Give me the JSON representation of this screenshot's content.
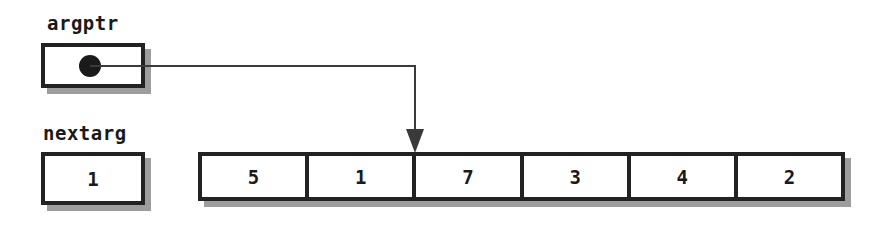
{
  "diagram": {
    "background_color": "#ffffff",
    "line_color": "#3a3a3a",
    "border_color": "#222222",
    "shadow_color": "#9d9d9d",
    "text_color": "#1a1a1a"
  },
  "pointer_variable": {
    "label": "argptr",
    "value": "",
    "dot_icon": "filled-circle-pointer-icon",
    "points_to_index": 2,
    "points_to_description": "boundary before third array cell"
  },
  "index_variable": {
    "label": "nextarg",
    "value": "1"
  },
  "array": {
    "name": "argument-array",
    "cells": [
      {
        "index": 0,
        "value": "5"
      },
      {
        "index": 1,
        "value": "1"
      },
      {
        "index": 2,
        "value": "7"
      },
      {
        "index": 3,
        "value": "3"
      },
      {
        "index": 4,
        "value": "4"
      },
      {
        "index": 5,
        "value": "2"
      }
    ]
  },
  "connector": {
    "name": "pointer-arrow",
    "arrowhead": "down-arrow-icon",
    "path_description": "from argptr dot right then down to array cell boundary"
  }
}
